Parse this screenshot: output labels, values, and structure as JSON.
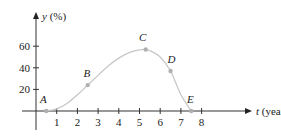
{
  "chart_data": {
    "type": "line",
    "title": "",
    "xlabel": "t (years)",
    "ylabel": "y (%)",
    "xlabel_var": "t",
    "xlabel_unit": "(years)",
    "ylabel_var": "y",
    "ylabel_unit": "(%)",
    "x_ticks": [
      1,
      2,
      3,
      4,
      5,
      6,
      7,
      8
    ],
    "y_ticks": [
      20,
      40,
      60
    ],
    "xlim": [
      -0.7,
      10.5
    ],
    "ylim": [
      -10,
      90
    ],
    "grid": false,
    "legend": null,
    "curve_color": "#c8c8c8",
    "point_color": "#b0b0b0",
    "labeled_points": [
      {
        "label": "A",
        "x": 0.5,
        "y": 0
      },
      {
        "label": "B",
        "x": 2.5,
        "y": 24
      },
      {
        "label": "C",
        "x": 5.3,
        "y": 57
      },
      {
        "label": "D",
        "x": 6.5,
        "y": 37
      },
      {
        "label": "E",
        "x": 7.5,
        "y": 0
      }
    ],
    "series": [
      {
        "name": "y(t)",
        "x": [
          0.5,
          1.0,
          1.5,
          2.0,
          2.5,
          3.0,
          3.5,
          4.0,
          4.5,
          5.0,
          5.3,
          5.6,
          6.0,
          6.5,
          7.0,
          7.5
        ],
        "values": [
          0,
          2,
          7,
          15,
          24,
          33,
          42,
          49,
          54,
          56.5,
          57,
          55,
          50,
          37,
          15,
          0
        ]
      }
    ]
  }
}
